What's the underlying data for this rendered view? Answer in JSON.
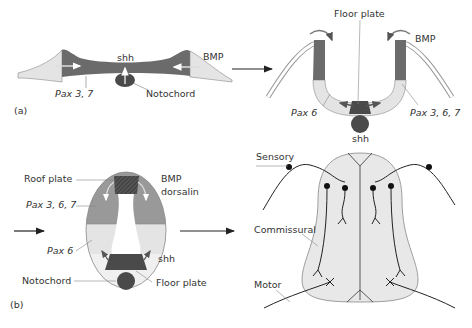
{
  "panel_a": {
    "label": "(a)",
    "stage1": {
      "shh": "shh",
      "bmp": "BMP",
      "pax": "Pax 3, 7",
      "notochord": "Notochord"
    },
    "stage2": {
      "floor_plate": "Floor plate",
      "bmp": "BMP",
      "pax6": "Pax 6",
      "pax367": "Pax 3, 6, 7",
      "shh": "shh"
    }
  },
  "panel_b": {
    "label": "(b)",
    "stage3": {
      "roof_plate": "Roof plate",
      "bmp_line1": "BMP",
      "bmp_line2": "dorsalin",
      "pax367": "Pax 3, 6, 7",
      "pax6": "Pax 6",
      "shh": "shh",
      "notochord": "Notochord",
      "floor_plate": "Floor plate"
    },
    "stage4": {
      "sensory": "Sensory",
      "commissural": "Commissural",
      "motor": "Motor"
    }
  },
  "colors": {
    "dark": "#6b6b6b",
    "mid": "#999999",
    "light": "#e4e4e4",
    "darkest": "#4a4a4a",
    "line": "#333333"
  }
}
